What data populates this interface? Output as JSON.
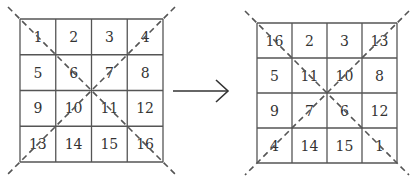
{
  "diagram": {
    "left_grid": {
      "cells": [
        [
          "1",
          "2",
          "3",
          "4"
        ],
        [
          "5",
          "6",
          "7",
          "8"
        ],
        [
          "9",
          "10",
          "11",
          "12"
        ],
        [
          "13",
          "14",
          "15",
          "16"
        ]
      ]
    },
    "right_grid": {
      "cells": [
        [
          "16",
          "2",
          "3",
          "13"
        ],
        [
          "5",
          "11",
          "10",
          "8"
        ],
        [
          "9",
          "7",
          "6",
          "12"
        ],
        [
          "4",
          "14",
          "15",
          "1"
        ]
      ]
    },
    "arrow": "right-arrow",
    "colors": {
      "line": "#444444",
      "text": "#333333",
      "dash": "#555555"
    }
  }
}
